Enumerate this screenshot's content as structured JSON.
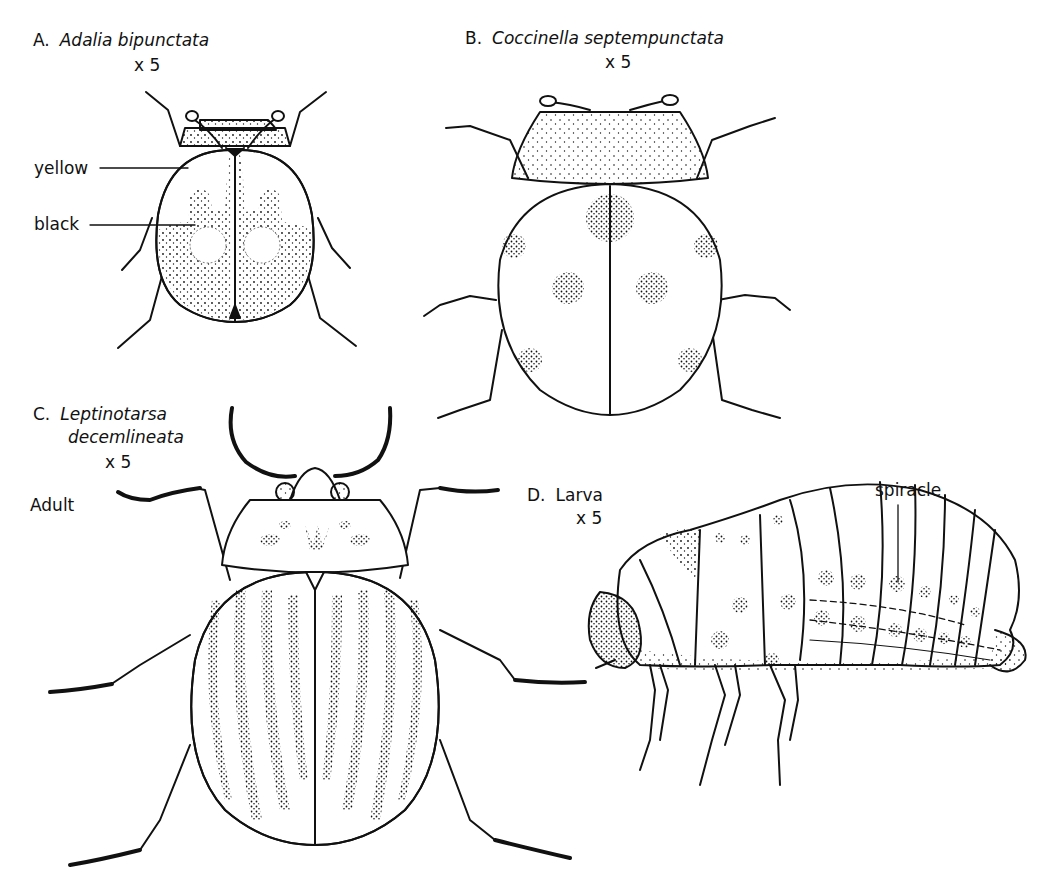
{
  "figures": [
    {
      "id": "A",
      "letter": "A.",
      "name": "Adalia bipunctata",
      "magnification": "x 5",
      "annotations": [
        {
          "text": "yellow"
        },
        {
          "text": "black"
        }
      ]
    },
    {
      "id": "B",
      "letter": "B.",
      "name": "Coccinella septempunctata",
      "magnification": "x 5"
    },
    {
      "id": "C",
      "letter": "C.",
      "name_line1": "Leptinotarsa",
      "name_line2": "decemlineata",
      "magnification": "x 5",
      "stage": "Adult"
    },
    {
      "id": "D",
      "letter": "D.",
      "name": "Larva",
      "magnification": "x 5",
      "annotations": [
        {
          "text": "spiracle"
        }
      ]
    }
  ],
  "colors": {
    "ink": "#111111",
    "paper": "#ffffff"
  }
}
